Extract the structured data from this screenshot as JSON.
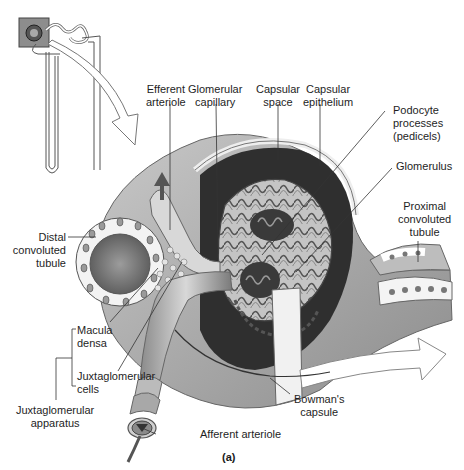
{
  "figure": {
    "caption": "(a)",
    "inset": {
      "name": "nephron-overview",
      "highlight": "renal-corpuscle-box"
    }
  },
  "labels": {
    "efferent_arteriole": [
      "Efferent",
      "arteriole"
    ],
    "glomerular_capillary": [
      "Glomerular",
      "capillary"
    ],
    "capsular_space": [
      "Capsular",
      "space"
    ],
    "capsular_epithelium": [
      "Capsular",
      "epithelium"
    ],
    "podocyte_processes": [
      "Podocyte",
      "processes",
      "(pedicels)"
    ],
    "glomerulus": [
      "Glomerulus"
    ],
    "proximal_convoluted_tubule": [
      "Proximal",
      "convoluted",
      "tubule"
    ],
    "distal_convoluted_tubule": [
      "Distal",
      "convoluted",
      "tubule"
    ],
    "macula_densa": [
      "Macula",
      "densa"
    ],
    "juxtaglomerular_cells": [
      "Juxtaglomerular",
      "cells"
    ],
    "juxtaglomerular_apparatus": [
      "Juxtaglomerular",
      "apparatus"
    ],
    "bowmans_capsule": [
      "Bowman's",
      "capsule"
    ],
    "afferent_arteriole": [
      "Afferent arteriole"
    ]
  },
  "colors": {
    "background": "#ffffff",
    "tissue_dark": "#5a5a5a",
    "tissue_mid": "#9a9a9a",
    "tissue_light": "#d6d6d6",
    "line": "#333333"
  }
}
